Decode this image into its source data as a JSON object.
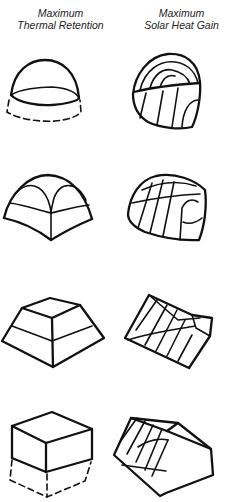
{
  "columns": [
    {
      "line1": "Maximum",
      "line2": "Thermal Retention"
    },
    {
      "line1": "Maximum",
      "line2": "Solar Heat Gain"
    }
  ],
  "rows": [
    {
      "shape": "hemisphere-dome",
      "left": "half-sphere dome with dashed base (thermal retention)",
      "right": "elongated glazed dome (solar gain)"
    },
    {
      "shape": "segmented-dome",
      "left": "four-segment dome",
      "right": "tilted glazed segmented dome"
    },
    {
      "shape": "truncated-pyramid",
      "left": "truncated pyramid",
      "right": "tilted glazed truncated pyramid"
    },
    {
      "shape": "box",
      "left": "cube with dashed lower half (earth-sheltered)",
      "right": "tilted box with glazed south face"
    }
  ],
  "colors": {
    "ink": "#111111",
    "background": "#ffffff"
  }
}
